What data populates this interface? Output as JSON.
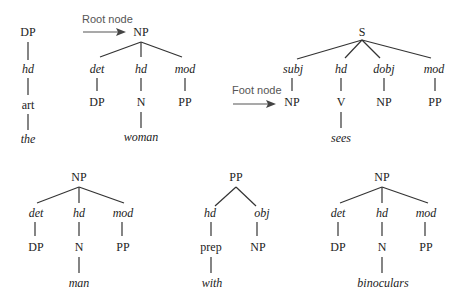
{
  "annotations": {
    "root_node": "Root node",
    "foot_node": "Foot node"
  },
  "trees": [
    {
      "id": "tree-dp",
      "root": "DP",
      "children": [
        {
          "rel": "hd",
          "cat": "art",
          "word": "the"
        }
      ]
    },
    {
      "id": "tree-np-woman",
      "root": "NP",
      "children": [
        {
          "rel": "det",
          "cat": "DP"
        },
        {
          "rel": "hd",
          "cat": "N",
          "word": "woman"
        },
        {
          "rel": "mod",
          "cat": "PP"
        }
      ]
    },
    {
      "id": "tree-s-sees",
      "root": "S",
      "children": [
        {
          "rel": "subj",
          "cat": "NP"
        },
        {
          "rel": "hd",
          "cat": "V",
          "word": "sees"
        },
        {
          "rel": "dobj",
          "cat": "NP"
        },
        {
          "rel": "mod",
          "cat": "PP"
        }
      ]
    },
    {
      "id": "tree-np-man",
      "root": "NP",
      "children": [
        {
          "rel": "det",
          "cat": "DP"
        },
        {
          "rel": "hd",
          "cat": "N",
          "word": "man"
        },
        {
          "rel": "mod",
          "cat": "PP"
        }
      ]
    },
    {
      "id": "tree-pp-with",
      "root": "PP",
      "children": [
        {
          "rel": "hd",
          "cat": "prep",
          "word": "with"
        },
        {
          "rel": "obj",
          "cat": "NP"
        }
      ]
    },
    {
      "id": "tree-np-binoculars",
      "root": "NP",
      "children": [
        {
          "rel": "det",
          "cat": "DP"
        },
        {
          "rel": "hd",
          "cat": "N",
          "word": "binoculars"
        },
        {
          "rel": "mod",
          "cat": "PP"
        }
      ]
    }
  ]
}
